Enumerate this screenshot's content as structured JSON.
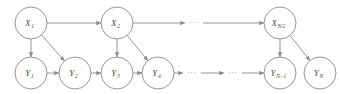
{
  "figure": {
    "type": "directed-graphical-model",
    "stroke_color": "#8a8a8a",
    "label_color": "#4a4a4a",
    "background_color": "#ffffff",
    "node_radius": 16
  },
  "top_row": {
    "name": "hidden-state-row",
    "nodes": [
      {
        "id": "x1",
        "base": "X",
        "sub": "1",
        "label": "X1",
        "cx": 31,
        "cy": 23
      },
      {
        "id": "x2",
        "base": "X",
        "sub": "2",
        "label": "X2",
        "cx": 117,
        "cy": 23
      },
      {
        "id": "xn2",
        "base": "X",
        "sub": "N/2",
        "label": "XN/2",
        "cx": 280,
        "cy": 23
      }
    ],
    "ellipses": [
      {
        "id": "top-ellipsis-1",
        "glyph": "···",
        "cx": 194,
        "cy": 23
      }
    ]
  },
  "bottom_row": {
    "name": "observation-row",
    "nodes": [
      {
        "id": "y1",
        "base": "Y",
        "sub": "1",
        "label": "Y1",
        "cx": 31,
        "cy": 73
      },
      {
        "id": "y2",
        "base": "Y",
        "sub": "2",
        "label": "Y2",
        "cx": 75,
        "cy": 73
      },
      {
        "id": "y3",
        "base": "Y",
        "sub": "3",
        "label": "Y3",
        "cx": 117,
        "cy": 73
      },
      {
        "id": "y4",
        "base": "Y",
        "sub": "4",
        "label": "Y4",
        "cx": 158,
        "cy": 73
      },
      {
        "id": "yn1",
        "base": "Y",
        "sub": "N−1",
        "label": "YN-1",
        "cx": 280,
        "cy": 73
      },
      {
        "id": "yn",
        "base": "Y",
        "sub": "N",
        "label": "YN",
        "cx": 320,
        "cy": 73
      }
    ],
    "ellipses": [
      {
        "id": "bottom-ellipsis-1",
        "glyph": "···",
        "cx": 192,
        "cy": 73
      },
      {
        "id": "bottom-ellipsis-2",
        "glyph": "···",
        "cx": 233,
        "cy": 73
      }
    ]
  },
  "edges": {
    "horizontal_top": [
      {
        "from": "x1",
        "to": "x2"
      },
      {
        "from": "x2",
        "to": "top-ellipsis-1"
      },
      {
        "from": "top-ellipsis-1",
        "to": "xn2"
      }
    ],
    "horizontal_bottom": [
      {
        "from": "y1",
        "to": "y2"
      },
      {
        "from": "y2",
        "to": "y3"
      },
      {
        "from": "y3",
        "to": "y4"
      },
      {
        "from": "y4",
        "to": "bottom-ellipsis-1"
      },
      {
        "from": "bottom-ellipsis-1",
        "to": "bottom-ellipsis-2"
      },
      {
        "from": "bottom-ellipsis-2",
        "to": "yn1"
      }
    ],
    "emission": [
      {
        "from": "x1",
        "to": "y1",
        "kind": "vertical"
      },
      {
        "from": "x1",
        "to": "y2",
        "kind": "diagonal"
      },
      {
        "from": "x2",
        "to": "y3",
        "kind": "vertical"
      },
      {
        "from": "x2",
        "to": "y4",
        "kind": "diagonal"
      },
      {
        "from": "xn2",
        "to": "yn1",
        "kind": "vertical"
      },
      {
        "from": "xn2",
        "to": "yn",
        "kind": "diagonal"
      }
    ]
  }
}
